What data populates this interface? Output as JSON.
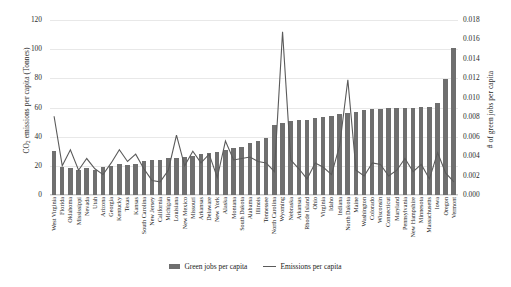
{
  "chart_data": {
    "type": "bar",
    "title": "",
    "xlabel": "",
    "ylabel": "CO2 emissions per capita (Tonnes)",
    "y2label": "# of green jobs per capita",
    "ylim": [
      0,
      120
    ],
    "y2lim": [
      0,
      0.018
    ],
    "yticks": [
      "0",
      "20",
      "40",
      "60",
      "80",
      "100",
      "120"
    ],
    "y2ticks": [
      "0.000",
      "0.002",
      "0.004",
      "0.006",
      "0.008",
      "0.010",
      "0.012",
      "0.014",
      "0.016",
      "0.018"
    ],
    "grid": true,
    "legend_position": "bottom",
    "categories": [
      "West Virginia",
      "Florida",
      "Oklahoma",
      "Mississippi",
      "Nevada",
      "Utah",
      "Arizona",
      "Georgia",
      "Kentucky",
      "Texas",
      "Kansas",
      "South Carolina",
      "New Jersey",
      "California",
      "Michigan",
      "Louisiana",
      "New Mexico",
      "Missouri",
      "Arkansas",
      "Delaware",
      "New York",
      "Alaska",
      "Montana",
      "South Dakota",
      "Alabama",
      "Illinois",
      "Tennessee",
      "North Carolina",
      "Wyoming",
      "Nebraska",
      "Arkansas",
      "Rhode Island",
      "Ohio",
      "Virginia",
      "Idaho",
      "Indiana",
      "North Dakota",
      "Maine",
      "Washington",
      "Colorado",
      "Wisconsin",
      "Connecticut",
      "Maryland",
      "Pennsylvania",
      "New Hampshire",
      "Minnesota",
      "Massachusetts",
      "Iowa",
      "Oregon",
      "Vermont"
    ],
    "series": [
      {
        "name": "Green jobs per capita",
        "axis": "right",
        "type": "bar",
        "color": "#6f6f6f",
        "values": [
          0.0045,
          0.00285,
          0.00275,
          0.00255,
          0.00275,
          0.0026,
          0.00285,
          0.00295,
          0.0032,
          0.0031,
          0.0032,
          0.0035,
          0.0036,
          0.0036,
          0.0038,
          0.00385,
          0.00395,
          0.004,
          0.0042,
          0.0043,
          0.00445,
          0.0046,
          0.0048,
          0.0049,
          0.0053,
          0.0056,
          0.0059,
          0.0072,
          0.0074,
          0.0076,
          0.0077,
          0.00775,
          0.0079,
          0.008,
          0.0081,
          0.0083,
          0.0084,
          0.0085,
          0.0087,
          0.0088,
          0.00885,
          0.0089,
          0.00895,
          0.009,
          0.009,
          0.00905,
          0.0091,
          0.0095,
          0.0119,
          0.0151
        ]
      },
      {
        "name": "Emissions per capita",
        "axis": "left",
        "type": "line",
        "color": "#5a5a5a",
        "values": [
          54,
          20,
          31,
          17,
          25,
          18,
          14,
          22,
          31,
          23,
          28,
          18,
          10,
          9,
          17,
          41,
          20,
          30,
          22,
          28,
          12,
          37,
          24,
          25,
          26,
          23,
          22,
          16,
          112,
          24,
          18,
          11,
          22,
          19,
          14,
          34,
          79,
          17,
          13,
          22,
          21,
          13,
          17,
          25,
          16,
          21,
          11,
          29,
          15,
          9
        ]
      }
    ]
  },
  "legend": {
    "items": [
      {
        "label": "Green jobs per capita",
        "marker": "bar-swatch"
      },
      {
        "label": "Emissions per capita",
        "marker": "line-swatch"
      }
    ]
  },
  "axis_titles": {
    "left_prefix": "CO",
    "left_sub": "2",
    "left_suffix": " emissions per capita (Tonnes)",
    "right": "# of green jobs per capita"
  }
}
